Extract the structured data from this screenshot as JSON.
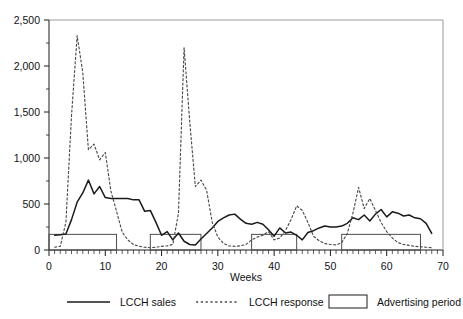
{
  "chart_data": {
    "type": "line",
    "title": "",
    "xlabel": "Weeks",
    "ylabel": "",
    "xlim": [
      0,
      70
    ],
    "ylim": [
      0,
      2500
    ],
    "ytick_labels": [
      "0",
      "500",
      "1,000",
      "1,500",
      "2,000",
      "2,500"
    ],
    "ytick_values": [
      0,
      500,
      1000,
      1500,
      2000,
      2500
    ],
    "xtick_labels": [
      "0",
      "10",
      "20",
      "30",
      "40",
      "50",
      "60",
      "70"
    ],
    "xtick_values": [
      0,
      10,
      20,
      30,
      40,
      50,
      60,
      70
    ],
    "minor_xtick_interval": 1,
    "grid": false,
    "legend_position": "bottom",
    "x": [
      1,
      2,
      3,
      4,
      5,
      6,
      7,
      8,
      9,
      10,
      11,
      12,
      13,
      14,
      15,
      16,
      17,
      18,
      19,
      20,
      21,
      22,
      23,
      24,
      25,
      26,
      27,
      28,
      29,
      30,
      31,
      32,
      33,
      34,
      35,
      36,
      37,
      38,
      39,
      40,
      41,
      42,
      43,
      44,
      45,
      46,
      47,
      48,
      49,
      50,
      51,
      52,
      53,
      54,
      55,
      56,
      57,
      58,
      59,
      60,
      61,
      62,
      63,
      64,
      65,
      66,
      67,
      68
    ],
    "series": [
      {
        "name": "LCCH sales",
        "style": "solid",
        "color": "#1a1a1a",
        "values": [
          160,
          165,
          175,
          330,
          520,
          620,
          760,
          610,
          690,
          570,
          560,
          560,
          560,
          560,
          545,
          545,
          420,
          430,
          300,
          160,
          200,
          110,
          185,
          95,
          60,
          55,
          120,
          180,
          240,
          310,
          350,
          380,
          390,
          335,
          290,
          280,
          300,
          280,
          220,
          150,
          240,
          185,
          195,
          160,
          110,
          190,
          210,
          240,
          260,
          250,
          250,
          260,
          290,
          350,
          330,
          380,
          315,
          390,
          440,
          360,
          415,
          400,
          370,
          380,
          350,
          340,
          290,
          180
        ]
      },
      {
        "name": "LCCH response",
        "style": "dotted",
        "color": "#4a4a4a",
        "values": [
          30,
          40,
          300,
          1460,
          2330,
          1930,
          1090,
          1150,
          980,
          1060,
          640,
          420,
          195,
          110,
          60,
          40,
          30,
          25,
          30,
          40,
          45,
          60,
          400,
          2200,
          1400,
          690,
          760,
          650,
          300,
          140,
          70,
          45,
          40,
          45,
          60,
          110,
          140,
          160,
          200,
          110,
          130,
          210,
          330,
          480,
          430,
          300,
          150,
          100,
          70,
          60,
          55,
          80,
          180,
          400,
          680,
          450,
          560,
          430,
          300,
          200,
          130,
          80,
          60,
          50,
          40,
          35,
          30,
          25
        ]
      }
    ],
    "advertising_periods": [
      {
        "start": 0,
        "end": 12,
        "level": 170
      },
      {
        "start": 18,
        "end": 27,
        "level": 170
      },
      {
        "start": 36,
        "end": 44,
        "level": 170
      },
      {
        "start": 52,
        "end": 66,
        "level": 170
      }
    ],
    "legend": [
      {
        "label": "LCCH sales",
        "marker": "solid-line"
      },
      {
        "label": "LCCH response",
        "marker": "dotted-line"
      },
      {
        "label": "Advertising period",
        "marker": "rectangle"
      }
    ]
  }
}
